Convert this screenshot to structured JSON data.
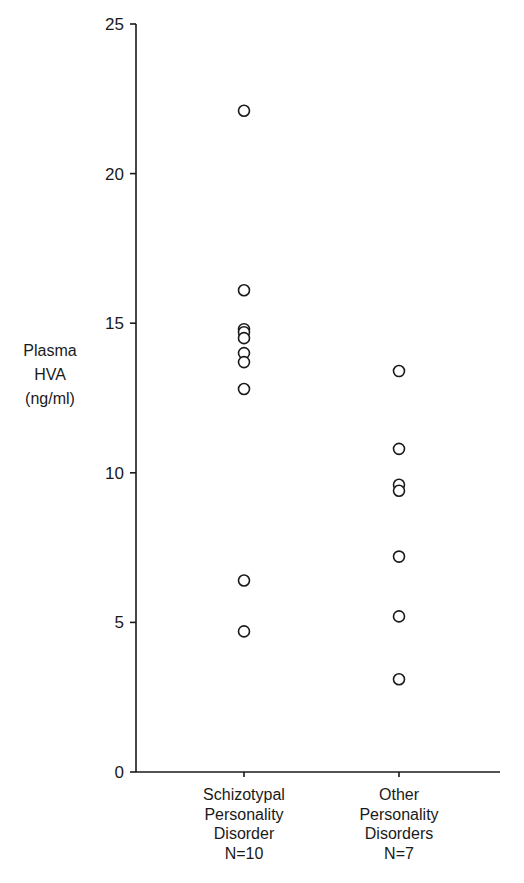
{
  "chart_data": {
    "type": "scatter",
    "subtype": "dot-strip-plot",
    "title": "",
    "xlabel": "",
    "ylabel": "Plasma HVA (ng/ml)",
    "ylabel_lines": [
      "Plasma",
      "HVA",
      "(ng/ml)"
    ],
    "ylim": [
      0,
      25
    ],
    "yticks": [
      0,
      5,
      10,
      15,
      20,
      25
    ],
    "grid": false,
    "legend": null,
    "marker": "open-circle",
    "categories": [
      {
        "name": "Schizotypal Personality Disorder",
        "label_lines": [
          "Schizotypal",
          "Personality",
          "Disorder",
          "N=10"
        ],
        "n": 10,
        "values": [
          22.1,
          16.1,
          14.8,
          14.7,
          14.5,
          14.0,
          13.7,
          12.8,
          6.4,
          4.7
        ]
      },
      {
        "name": "Other Personality Disorders",
        "label_lines": [
          "Other",
          "Personality",
          "Disorders",
          "N=7"
        ],
        "n": 7,
        "values": [
          13.4,
          10.8,
          9.6,
          9.4,
          7.2,
          5.2,
          3.1
        ]
      }
    ]
  },
  "colors": {
    "ink": "#1a1a1a",
    "background": "#ffffff"
  }
}
